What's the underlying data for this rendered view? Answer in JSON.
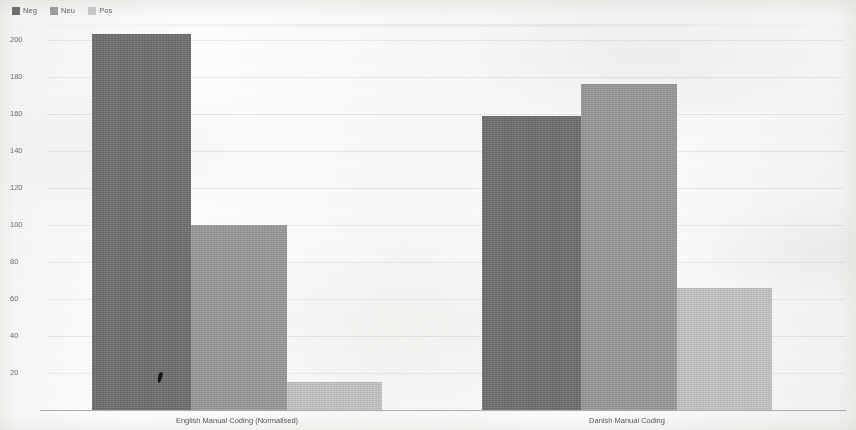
{
  "chart_data": {
    "type": "bar",
    "title": "",
    "subtitle": "",
    "xlabel": "",
    "ylabel": "",
    "categories": [
      "English Manual Coding (Normalised)",
      "Danish Manual Coding"
    ],
    "series": [
      {
        "name": "Neg",
        "color": "#6f6f6f",
        "values": [
          203,
          159
        ]
      },
      {
        "name": "Neu",
        "color": "#9a9a9a",
        "values": [
          100,
          176
        ]
      },
      {
        "name": "Pos",
        "color": "#c6c6c6",
        "values": [
          15,
          66
        ]
      }
    ],
    "ylim": [
      0,
      210
    ],
    "yticks": [
      20,
      40,
      60,
      80,
      100,
      120,
      140,
      160,
      180,
      200
    ],
    "ytick_labels": [
      "20",
      "40",
      "60",
      "80",
      "100",
      "120",
      "140",
      "160",
      "180",
      "200"
    ],
    "grid": true,
    "grid_axis": "y",
    "legend_position": "top-left",
    "bar_gap": 0,
    "annotations": []
  },
  "legend": {
    "items": [
      {
        "label": "Neg",
        "color": "#6f6f6f"
      },
      {
        "label": "Neu",
        "color": "#9a9a9a"
      },
      {
        "label": "Pos",
        "color": "#c6c6c6"
      }
    ]
  },
  "axes": {
    "y_tick_labels": [
      "200",
      "180",
      "160",
      "140",
      "120",
      "100",
      "80",
      "60",
      "40",
      "20"
    ],
    "x_category_labels": [
      "English Manual Coding (Normalised)",
      "Danish Manual Coding"
    ]
  }
}
